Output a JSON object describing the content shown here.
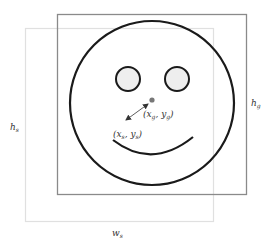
{
  "diagram": {
    "labels": {
      "gaze_point": {
        "x": "x",
        "x_sub": "g",
        "y": "y",
        "y_sub": "g"
      },
      "start_point": {
        "x": "x",
        "x_sub": "s",
        "y": "y",
        "y_sub": "s"
      },
      "height_s": {
        "base": "h",
        "sub": "s"
      },
      "height_g": {
        "base": "h",
        "sub": "g"
      },
      "width_s": {
        "base": "w",
        "sub": "s"
      }
    },
    "colors": {
      "outer_box_g": "#8a8a8a",
      "outer_box_s": "#dddddd",
      "face_stroke": "#1a1a1a",
      "eye_fill": "#eeeeee",
      "nose_fill": "#777777",
      "arrow": "#333333",
      "label_text": "#333333"
    }
  }
}
